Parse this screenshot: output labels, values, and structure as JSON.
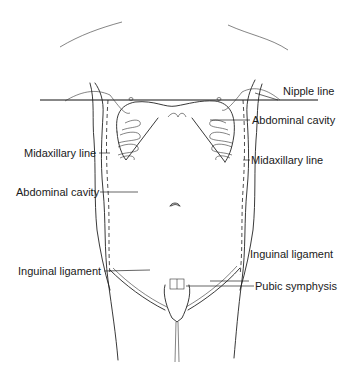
{
  "figure": {
    "labels": {
      "nipple_line": "Nipple line",
      "abdominal_cavity_right": "Abdominal cavity",
      "midaxillary_line_left": "Midaxillary line",
      "midaxillary_line_right": "Midaxillary line",
      "abdominal_cavity_left": "Abdominal cavity",
      "inguinal_ligament_right": "Inguinal ligament",
      "inguinal_ligament_left": "Inguinal ligament",
      "pubic_symphysis": "Pubic symphysis"
    },
    "colors": {
      "line": "#222222",
      "background": "#ffffff"
    }
  }
}
